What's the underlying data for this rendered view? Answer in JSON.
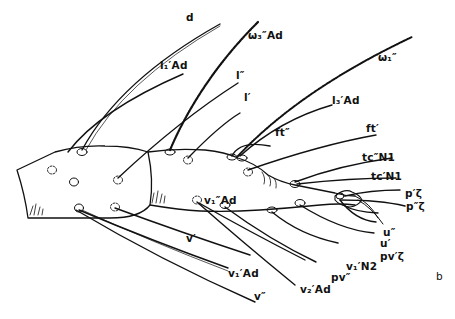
{
  "figure": {
    "panel_label": "b",
    "colors": {
      "ink": "#111111",
      "background": "#ffffff"
    }
  },
  "setae_labels": {
    "d": "d",
    "l1_Ad": "l₁′Ad",
    "omega3_Ad": "ω₃″Ad",
    "l_dprime": "l″",
    "l_prime": "l′",
    "omega1": "ω₁″",
    "l3_Ad": "l₃′Ad",
    "ft_dprime": "ft″",
    "ft_prime": "ft′",
    "tc_dprime_N1": "tc″N1",
    "tc_prime_N1": "tc′N1",
    "p_prime_zeta": "p′ζ",
    "p_dprime_zeta": "p″ζ",
    "u_dprime": "u″",
    "u_prime": "u′",
    "pv_prime_zeta": "pv′ζ",
    "v1_N2": "v₁′N2",
    "pv_dprime": "pv″",
    "v2_Ad": "v₂′Ad",
    "v1_dprime_Ad": "v₁″Ad",
    "v_prime": "v′",
    "v1_Ad": "v₁′Ad",
    "v_dprime": "v″"
  }
}
